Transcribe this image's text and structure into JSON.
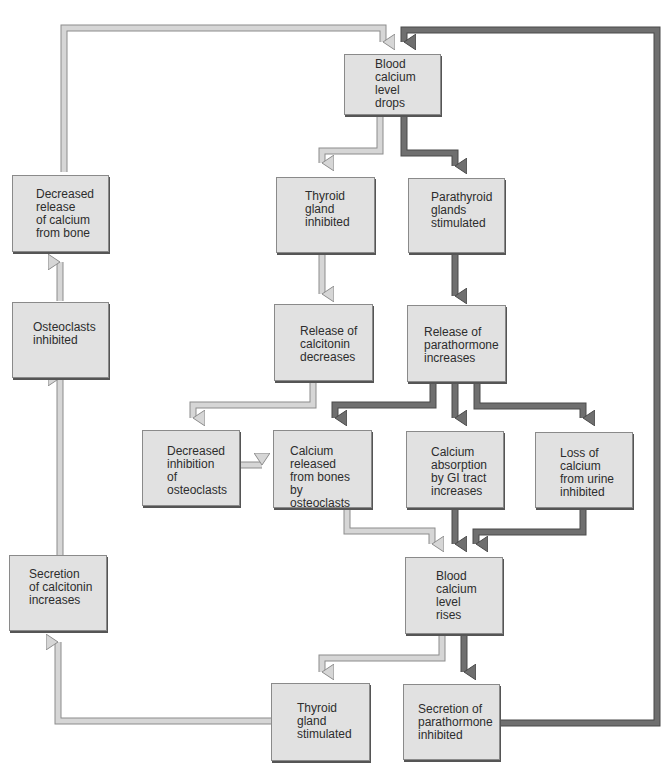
{
  "colors": {
    "box_fill": "#e1e1e1",
    "light_arrow_fill": "#d6d6d6",
    "light_arrow_edge": "#8c8c8c",
    "dark_arrow_fill": "#6f6f6f",
    "dark_arrow_edge": "#4a4a4a"
  },
  "nodes": {
    "blood_calcium_drops": "Blood\ncalcium\nlevel\ndrops",
    "thyroid_inhibited": "Thyroid\ngland\ninhibited",
    "parathyroid_stimulated": "Parathyroid\nglands\nstimulated",
    "calcitonin_decreases": "Release of\ncalcitonin\ndecreases",
    "parathormone_increases": "Release of\nparathormone\nincreases",
    "decreased_inhibition_osteoclasts": "Decreased\ninhibition\nof\nosteoclasts",
    "calcium_released_bones": "Calcium\nreleased\nfrom bones\nby osteoclasts",
    "calcium_absorption_gi": "Calcium\nabsorption\nby GI tract\nincreases",
    "loss_calcium_urine": "Loss of\ncalcium\nfrom urine\ninhibited",
    "blood_calcium_rises": "Blood\ncalcium\nlevel\nrises",
    "thyroid_stimulated": "Thyroid\ngland\nstimulated",
    "parathormone_inhibited": "Secretion of\nparathormone\ninhibited",
    "calcitonin_secretion_increases": "Secretion\nof calcitonin\nincreases",
    "osteoclasts_inhibited": "Osteoclasts\ninhibited",
    "decreased_release_bone": "Decreased\nrelease\nof calcium\nfrom bone"
  },
  "edges": [
    {
      "from": "blood_calcium_drops",
      "to": "thyroid_inhibited",
      "style": "light"
    },
    {
      "from": "blood_calcium_drops",
      "to": "parathyroid_stimulated",
      "style": "dark"
    },
    {
      "from": "thyroid_inhibited",
      "to": "calcitonin_decreases",
      "style": "light"
    },
    {
      "from": "parathyroid_stimulated",
      "to": "parathormone_increases",
      "style": "dark"
    },
    {
      "from": "calcitonin_decreases",
      "to": "decreased_inhibition_osteoclasts",
      "style": "light"
    },
    {
      "from": "decreased_inhibition_osteoclasts",
      "to": "calcium_released_bones",
      "style": "light"
    },
    {
      "from": "parathormone_increases",
      "to": "calcium_released_bones",
      "style": "dark"
    },
    {
      "from": "parathormone_increases",
      "to": "calcium_absorption_gi",
      "style": "dark"
    },
    {
      "from": "parathormone_increases",
      "to": "loss_calcium_urine",
      "style": "dark"
    },
    {
      "from": "calcium_released_bones",
      "to": "blood_calcium_rises",
      "style": "light"
    },
    {
      "from": "calcium_absorption_gi",
      "to": "blood_calcium_rises",
      "style": "dark"
    },
    {
      "from": "loss_calcium_urine",
      "to": "blood_calcium_rises",
      "style": "dark"
    },
    {
      "from": "blood_calcium_rises",
      "to": "thyroid_stimulated",
      "style": "light"
    },
    {
      "from": "blood_calcium_rises",
      "to": "parathormone_inhibited",
      "style": "dark"
    },
    {
      "from": "thyroid_stimulated",
      "to": "calcitonin_secretion_increases",
      "style": "light"
    },
    {
      "from": "calcitonin_secretion_increases",
      "to": "osteoclasts_inhibited",
      "style": "light"
    },
    {
      "from": "osteoclasts_inhibited",
      "to": "decreased_release_bone",
      "style": "light"
    },
    {
      "from": "decreased_release_bone",
      "to": "blood_calcium_drops",
      "style": "light"
    },
    {
      "from": "parathormone_inhibited",
      "to": "blood_calcium_drops",
      "style": "dark"
    }
  ]
}
